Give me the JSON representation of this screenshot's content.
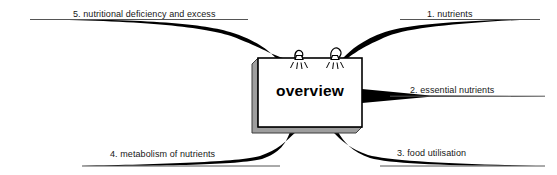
{
  "diagram": {
    "type": "mind-map",
    "center": {
      "label": "overview",
      "shape": "3d-box",
      "face_color": "#ffffff",
      "shadow_color": "#9a9a9a",
      "border_color": "#000000"
    },
    "branch_color": "#000000",
    "line_color": "#4d4d4d",
    "background": "#ffffff",
    "branches": [
      {
        "id": "1",
        "label": "1. nutrients",
        "direction": "upper-right",
        "number": "1",
        "text": "nutrients"
      },
      {
        "id": "2",
        "label": "2. essential nutrients",
        "direction": "right",
        "number": "2",
        "text": "essential nutrients"
      },
      {
        "id": "3",
        "label": "3. food utilisation",
        "direction": "lower-right",
        "number": "3",
        "text": "food utilisation"
      },
      {
        "id": "4",
        "label": "4. metabolism of nutrients",
        "direction": "lower-left",
        "number": "4",
        "text": "metabolism of nutrients"
      },
      {
        "id": "5",
        "label": "5. nutritional deficiency and excess",
        "direction": "upper-left",
        "number": "5",
        "text": "nutritional deficiency and excess"
      }
    ],
    "ornaments": [
      {
        "name": "lamp-icon-left"
      },
      {
        "name": "lamp-icon-right"
      }
    ]
  }
}
